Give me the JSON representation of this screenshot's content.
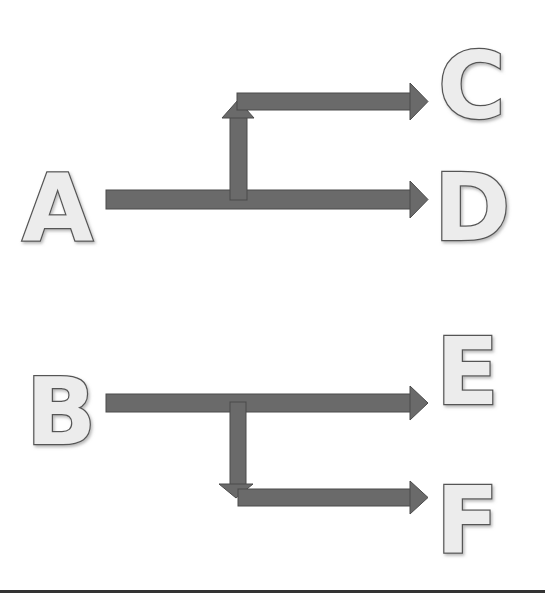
{
  "diagram": {
    "nodes": {
      "A": "A",
      "B": "B",
      "C": "C",
      "D": "D",
      "E": "E",
      "F": "F"
    },
    "edges": [
      {
        "from": "A",
        "to": "C",
        "style": "branch-up"
      },
      {
        "from": "A",
        "to": "D",
        "style": "straight"
      },
      {
        "from": "B",
        "to": "E",
        "style": "straight"
      },
      {
        "from": "B",
        "to": "F",
        "style": "branch-down"
      }
    ],
    "colors": {
      "arrow": "#6a6a6a",
      "letter_fill": "#ececec",
      "letter_outline": "#555555"
    }
  }
}
